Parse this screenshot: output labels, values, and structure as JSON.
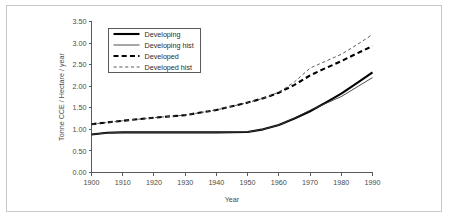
{
  "figure": {
    "border_color": "#c9c9c9",
    "background": "#ffffff"
  },
  "chart_data": {
    "type": "line",
    "title": "",
    "xlabel": "Year",
    "ylabel": "Tonne CCE / Hectare / year",
    "xlim": [
      1900,
      1990
    ],
    "ylim": [
      0.0,
      3.5
    ],
    "xticks": [
      1900,
      1910,
      1920,
      1930,
      1940,
      1950,
      1960,
      1970,
      1980,
      1990
    ],
    "xticklabels": [
      "1900",
      "1910",
      "1920",
      "1930",
      "1940",
      "1950",
      "1960",
      "1970",
      "1980",
      "1990"
    ],
    "yticks": [
      0.0,
      0.5,
      1.0,
      1.5,
      2.0,
      2.5,
      3.0,
      3.5
    ],
    "yticklabels": [
      "0.00",
      "0.50",
      "1.00",
      "1.50",
      "2.00",
      "2.50",
      "3.00",
      "3.50"
    ],
    "grid": false,
    "legend_position": "upper-left-inside",
    "series": [
      {
        "name": "Developing",
        "style": "solid",
        "width": 2.1,
        "color": "#000000",
        "x": [
          1900,
          1905,
          1910,
          1920,
          1930,
          1940,
          1950,
          1955,
          1960,
          1965,
          1970,
          1975,
          1980,
          1985,
          1990
        ],
        "values": [
          0.88,
          0.92,
          0.93,
          0.93,
          0.93,
          0.93,
          0.94,
          1.0,
          1.1,
          1.25,
          1.42,
          1.62,
          1.83,
          2.07,
          2.32
        ]
      },
      {
        "name": "Developing hist",
        "style": "solid",
        "width": 0.9,
        "color": "#3a3a3a",
        "x": [
          1900,
          1905,
          1910,
          1920,
          1930,
          1940,
          1950,
          1955,
          1960,
          1965,
          1970,
          1975,
          1980,
          1985,
          1990
        ],
        "values": [
          0.88,
          0.92,
          0.93,
          0.93,
          0.93,
          0.93,
          0.94,
          1.0,
          1.1,
          1.26,
          1.44,
          1.6,
          1.76,
          1.98,
          2.2
        ]
      },
      {
        "name": "Developed",
        "style": "dashed",
        "width": 2.1,
        "color": "#000000",
        "x": [
          1900,
          1910,
          1920,
          1930,
          1940,
          1950,
          1955,
          1960,
          1965,
          1970,
          1975,
          1980,
          1985,
          1990
        ],
        "values": [
          1.12,
          1.2,
          1.27,
          1.33,
          1.45,
          1.62,
          1.72,
          1.85,
          2.03,
          2.25,
          2.42,
          2.58,
          2.76,
          2.93
        ]
      },
      {
        "name": "Developed hist",
        "style": "dotted-dash",
        "width": 0.9,
        "color": "#4a4a4a",
        "x": [
          1900,
          1910,
          1920,
          1930,
          1940,
          1950,
          1955,
          1960,
          1965,
          1970,
          1975,
          1980,
          1985,
          1990
        ],
        "values": [
          1.12,
          1.2,
          1.27,
          1.33,
          1.45,
          1.62,
          1.72,
          1.86,
          2.1,
          2.42,
          2.58,
          2.74,
          2.96,
          3.2
        ]
      }
    ]
  },
  "legend": {
    "items": [
      {
        "label": "Developing"
      },
      {
        "label": "Developing hist"
      },
      {
        "label": "Developed"
      },
      {
        "label": "Developed hist"
      }
    ]
  }
}
